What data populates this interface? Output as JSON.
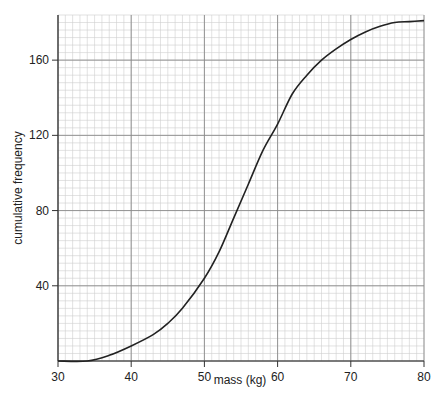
{
  "chart_data": {
    "type": "line",
    "title": "",
    "xlabel": "mass (kg)",
    "ylabel": "cumulative frequency",
    "xlim": [
      30,
      80
    ],
    "ylim": [
      0,
      184
    ],
    "x_ticks": [
      30,
      40,
      50,
      60,
      70,
      80
    ],
    "y_ticks": [
      40,
      80,
      120,
      160
    ],
    "grid": {
      "major_x": 10,
      "major_y": 40,
      "minor_x": 1,
      "minor_y": 4
    },
    "series": [
      {
        "name": "cumulative frequency curve",
        "x": [
          30,
          34,
          37,
          40,
          43,
          45,
          47,
          50,
          52,
          54,
          56,
          58,
          60,
          62,
          64,
          66,
          68,
          70,
          72,
          74,
          76,
          78,
          80
        ],
        "values": [
          0,
          0,
          3,
          8,
          14,
          20,
          28,
          44,
          58,
          76,
          94,
          112,
          126,
          142,
          152,
          160,
          166,
          171,
          175,
          178,
          180,
          180.5,
          181
        ]
      }
    ],
    "colors": {
      "curve": "#222222",
      "major_grid": "#8a8a8a",
      "minor_grid": "#cfcfcf"
    }
  }
}
